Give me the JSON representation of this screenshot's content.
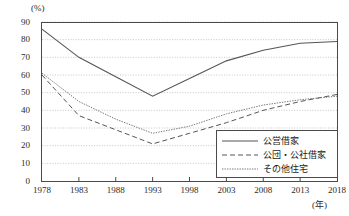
{
  "chart_data": {
    "type": "line",
    "title": "",
    "xlabel": "(年)",
    "ylabel": "(%)",
    "x": [
      1978,
      1983,
      1988,
      1993,
      1998,
      2003,
      2008,
      2013,
      2018
    ],
    "xtick_labels": [
      "1978",
      "1983",
      "1988",
      "1993",
      "1998",
      "2003",
      "2008",
      "2013",
      "2018"
    ],
    "ytick_labels": [
      "0",
      "10",
      "20",
      "30",
      "40",
      "50",
      "60",
      "70",
      "80",
      "90"
    ],
    "ylim": [
      0,
      90
    ],
    "ytick_step": 10,
    "grid": true,
    "legend_position": "bottom-right",
    "series": [
      {
        "name": "公営借家",
        "style": "solid",
        "color": "#555555",
        "values": [
          86,
          70,
          59,
          48,
          58,
          68,
          74,
          78,
          79
        ]
      },
      {
        "name": "公団・公社借家",
        "style": "dashed",
        "color": "#555555",
        "values": [
          60,
          37,
          29,
          21,
          27,
          33,
          40,
          45,
          49
        ]
      },
      {
        "name": "その他住宅",
        "style": "dotted",
        "color": "#555555",
        "values": [
          61,
          45,
          35,
          27,
          31,
          38,
          43,
          46,
          48
        ]
      }
    ]
  },
  "axis": {
    "y_unit": "(%)",
    "x_unit": "(年)"
  },
  "legend": {
    "items": [
      {
        "label": "公営借家",
        "sample": "solid-line-sample"
      },
      {
        "label": "公団・公社借家",
        "sample": "dashed-line-sample"
      },
      {
        "label": "その他住宅",
        "sample": "dotted-line-sample"
      }
    ]
  }
}
